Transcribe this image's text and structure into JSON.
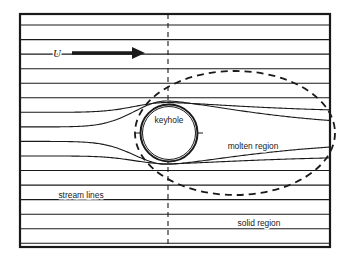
{
  "figure": {
    "type": "schematic-diagram",
    "background_color": "#ffffff",
    "line_color": "#1a1a1a",
    "frame": {
      "name": "domain-border",
      "x": 20,
      "y": 14,
      "width": 310,
      "height": 233,
      "stroke_width": 2.2
    },
    "labels": {
      "velocity": "U",
      "keyhole": "keyhole",
      "molten_region": "molten region",
      "stream_lines": "stream lines",
      "solid_region": "solid region"
    },
    "label_positions": {
      "velocity": {
        "x": 57,
        "y": 57
      },
      "keyhole": {
        "x": 169,
        "y": 123
      },
      "molten_region": {
        "x": 253,
        "y": 149
      },
      "stream_lines": {
        "x": 81,
        "y": 198
      },
      "solid_region": {
        "x": 259,
        "y": 226
      }
    },
    "arrow": {
      "name": "flow-direction-arrow",
      "x_start": 72,
      "x_end": 145,
      "y": 53,
      "shaft_width": 3.6,
      "head_length": 13,
      "head_half_height": 6
    },
    "keyhole_circle": {
      "name": "keyhole-boundary",
      "cx": 169,
      "cy": 133,
      "r_outer": 28.5,
      "r_inner": 26.5,
      "stroke_width_outer": 2.0,
      "stroke_width_inner": 1.0
    },
    "molten_ellipse": {
      "name": "molten-region-boundary",
      "cx": 235,
      "cy": 133,
      "rx": 100,
      "ry": 62,
      "dash": "7,5",
      "stroke_width": 1.8
    },
    "centerline_vertical": {
      "name": "vertical-centerline",
      "x": 168,
      "y_top": 14,
      "y_bottom": 247,
      "dash": "5,4"
    },
    "centerline_horizontal": {
      "name": "horizontal-centerline",
      "y": 133,
      "x_start": 135,
      "x_end": 203,
      "dash": "5,4"
    },
    "streamlines": {
      "count": 16,
      "spacing": 14.56,
      "first_y": 25,
      "stroke_width": 1.1,
      "y_values": [
        25.0,
        39.6,
        54.1,
        68.7,
        83.2,
        97.8,
        112.3,
        126.9,
        141.4,
        156.0,
        170.5,
        185.1,
        199.6,
        214.2,
        228.7,
        243.3
      ]
    }
  },
  "chart_data": {
    "type": "line",
    "xlabel": "",
    "ylabel": "",
    "legend": [
      "stream lines",
      "keyhole",
      "molten region",
      "solid region"
    ],
    "annotations": [
      "U",
      "keyhole",
      "molten region",
      "stream lines",
      "solid region"
    ],
    "series": [
      {
        "name": "streamline-row-1",
        "y": 25.0
      },
      {
        "name": "streamline-row-2",
        "y": 39.6
      },
      {
        "name": "streamline-row-3",
        "y": 54.1
      },
      {
        "name": "streamline-row-4",
        "y": 68.7
      },
      {
        "name": "streamline-row-5",
        "y": 83.2
      },
      {
        "name": "streamline-row-6",
        "y": 97.8
      },
      {
        "name": "streamline-row-7",
        "y": 112.3
      },
      {
        "name": "streamline-row-8",
        "y": 126.9
      },
      {
        "name": "streamline-row-9",
        "y": 141.4
      },
      {
        "name": "streamline-row-10",
        "y": 156.0
      },
      {
        "name": "streamline-row-11",
        "y": 170.5
      },
      {
        "name": "streamline-row-12",
        "y": 185.1
      },
      {
        "name": "streamline-row-13",
        "y": 199.6
      },
      {
        "name": "streamline-row-14",
        "y": 214.2
      },
      {
        "name": "streamline-row-15",
        "y": 228.7
      },
      {
        "name": "streamline-row-16",
        "y": 243.3
      }
    ]
  }
}
